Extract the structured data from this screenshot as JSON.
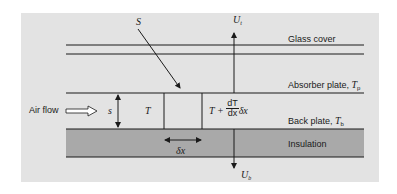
{
  "diagram": {
    "labels": {
      "solar": "S",
      "top_loss": "U",
      "top_loss_sub": "t",
      "bottom_loss": "U",
      "bottom_loss_sub": "b",
      "glass_cover": "Glass cover",
      "absorber": "Absorber plate, ",
      "absorber_T": "T",
      "absorber_sub": "p",
      "back_plate": "Back plate, ",
      "back_T": "T",
      "back_sub": "b",
      "insulation": "Insulation",
      "air_flow": "Air flow",
      "gap": "s",
      "temp_in": "T",
      "temp_out_prefix": "T +",
      "deriv_num": "dT",
      "deriv_den": "dx",
      "deriv_suffix": "δx",
      "element_width": "δx"
    },
    "colors": {
      "background": "#e3e3e3",
      "insulation": "#a9a9a9",
      "line": "#1a1a1a"
    }
  }
}
